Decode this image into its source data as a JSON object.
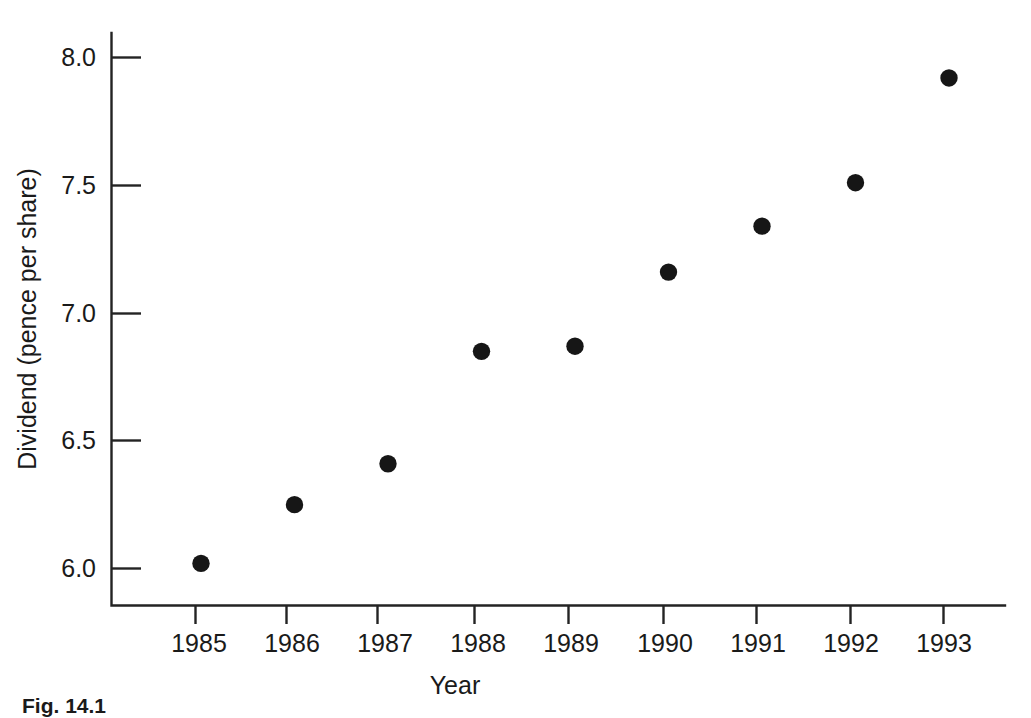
{
  "figure": {
    "caption": "Fig. 14.1"
  },
  "chart_data": {
    "type": "scatter",
    "title": "",
    "xlabel": "Year",
    "ylabel": "Dividend (pence per share)",
    "categories": [
      1985,
      1986,
      1987,
      1988,
      1989,
      1990,
      1991,
      1992,
      1993
    ],
    "x": [
      1985,
      1986,
      1987,
      1988,
      1989,
      1990,
      1991,
      1992,
      1993
    ],
    "values": [
      6.02,
      6.25,
      6.41,
      6.85,
      6.87,
      7.16,
      7.34,
      7.51,
      7.92
    ],
    "series": [
      {
        "name": "Dividend",
        "values": [
          6.02,
          6.25,
          6.41,
          6.85,
          6.87,
          7.16,
          7.34,
          7.51,
          7.92
        ]
      }
    ],
    "xtick_labels": [
      "1985",
      "1986",
      "1987",
      "1988",
      "1989",
      "1990",
      "1991",
      "1992",
      "1993"
    ],
    "ytick_labels": [
      "6.0",
      "6.5",
      "7.0",
      "7.5",
      "8.0"
    ],
    "yticks": [
      6.0,
      6.5,
      7.0,
      7.5,
      8.0
    ],
    "ylim": [
      5.85,
      8.11
    ],
    "xlim": [
      1984.4,
      1993.7
    ],
    "grid": false,
    "legend": false,
    "marker": "filled-circle",
    "marker_color": "#161616",
    "axis_color": "#232323"
  }
}
